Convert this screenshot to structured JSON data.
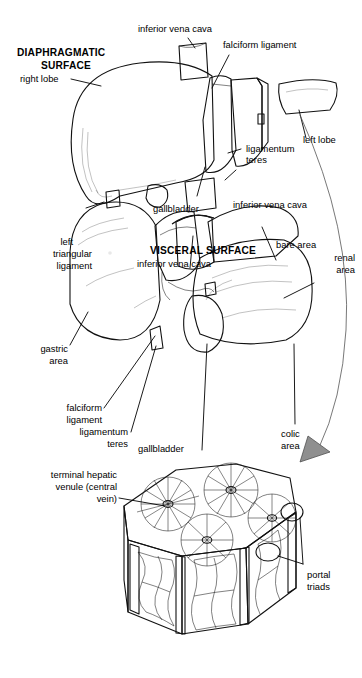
{
  "figure": {
    "style": "grayscale medical line illustration",
    "background": "#ffffff",
    "ink_color": "#111111",
    "liver_fill": "#8a8a8a",
    "liver_fill_dark": "#6f6f6f",
    "liver_fill_light": "#a3a3a3",
    "ligament_fill": "#d8d8d4",
    "lobule_fill": "#9a9a9a"
  },
  "panels": [
    {
      "id": "diaphragmatic",
      "heading": "DIAPHRAGMATIC SURFACE",
      "heading_lines": [
        "DIAPHRAGMATIC",
        "SURFACE"
      ],
      "labels": [
        {
          "id": "ivc-top",
          "text": "inferior vena cava",
          "lines": [
            "inferior vena cava"
          ],
          "align": "middle"
        },
        {
          "id": "falciform-top",
          "text": "falciform ligament",
          "lines": [
            "falciform ligament"
          ],
          "align": "start"
        },
        {
          "id": "right-lobe",
          "text": "right lobe",
          "lines": [
            "right lobe"
          ],
          "align": "end"
        },
        {
          "id": "left-lobe",
          "text": "left lobe",
          "lines": [
            "left lobe"
          ],
          "align": "start"
        },
        {
          "id": "lig-teres-top",
          "text": "ligamentum teres",
          "lines": [
            "ligamentum",
            "teres"
          ],
          "align": "start"
        },
        {
          "id": "gallbladder-top",
          "text": "gallbladder",
          "lines": [
            "gallbladder"
          ],
          "align": "middle"
        },
        {
          "id": "ivc-bottom",
          "text": "inferior vena cava",
          "lines": [
            "inferior vena cava"
          ],
          "align": "start"
        }
      ]
    },
    {
      "id": "visceral",
      "heading": "VISCERAL SURFACE",
      "heading_lines": [
        "VISCERAL SURFACE"
      ],
      "labels": [
        {
          "id": "left-triangular",
          "text": "left triangular ligament",
          "lines": [
            "left",
            "triangular",
            "ligament"
          ],
          "align": "end"
        },
        {
          "id": "ivc-visceral",
          "text": "inferior vena cava",
          "lines": [
            "inferior vena cava"
          ],
          "align": "middle"
        },
        {
          "id": "bare-area",
          "text": "bare area",
          "lines": [
            "bare area"
          ],
          "align": "start"
        },
        {
          "id": "renal-area",
          "text": "renal area",
          "lines": [
            "renal",
            "area"
          ],
          "align": "end"
        },
        {
          "id": "gastric-area",
          "text": "gastric area",
          "lines": [
            "gastric",
            "area"
          ],
          "align": "end"
        },
        {
          "id": "falciform-vis",
          "text": "falciform ligament",
          "lines": [
            "falciform",
            "ligament"
          ],
          "align": "end"
        },
        {
          "id": "lig-teres-vis",
          "text": "ligamentum teres",
          "lines": [
            "ligamentum",
            "teres"
          ],
          "align": "end"
        },
        {
          "id": "gallbladder-vis",
          "text": "gallbladder",
          "lines": [
            "gallbladder"
          ],
          "align": "start"
        },
        {
          "id": "colic-area",
          "text": "colic area",
          "lines": [
            "colic",
            "area"
          ],
          "align": "middle"
        }
      ]
    },
    {
      "id": "lobule",
      "heading": "",
      "heading_lines": [],
      "labels": [
        {
          "id": "central-vein",
          "text": "terminal hepatic venule (central vein)",
          "lines": [
            "terminal hepatic",
            "venule (central",
            "vein)"
          ],
          "align": "end"
        },
        {
          "id": "portal-triads",
          "text": "portal triads",
          "lines": [
            "portal",
            "triads"
          ],
          "align": "start"
        }
      ]
    }
  ],
  "text": {
    "diaphragmatic_l1": "DIAPHRAGMATIC",
    "diaphragmatic_l2": "SURFACE",
    "visceral": "VISCERAL SURFACE",
    "inferior_vena_cava": "inferior vena cava",
    "falciform_ligament": "falciform ligament",
    "falciform": "falciform",
    "ligament": "ligament",
    "right_lobe": "right lobe",
    "left_lobe": "left lobe",
    "ligamentum": "ligamentum",
    "teres": "teres",
    "gallbladder": "gallbladder",
    "left": "left",
    "triangular": "triangular",
    "bare_area": "bare area",
    "renal": "renal",
    "area": "area",
    "gastric": "gastric",
    "colic": "colic",
    "terminal_hepatic": "terminal hepatic",
    "venule_central": "venule (central",
    "vein": "vein)",
    "portal": "portal",
    "triads": "triads"
  }
}
